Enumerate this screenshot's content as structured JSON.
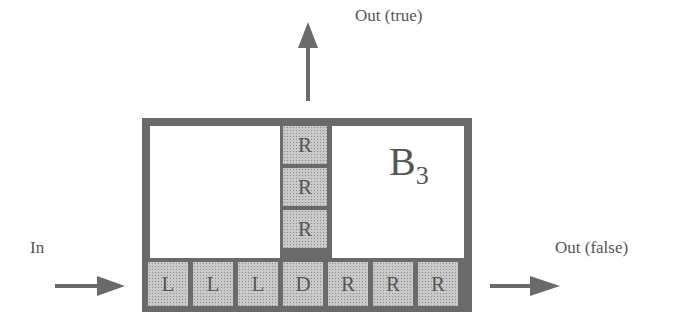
{
  "labels": {
    "out_true": "Out (true)",
    "out_false": "Out (false)",
    "in": "In"
  },
  "block": {
    "name": "B",
    "subscript": "3"
  },
  "column_cells": [
    "R",
    "R",
    "R"
  ],
  "row_cells": [
    "L",
    "L",
    "L",
    "D",
    "R",
    "R",
    "R"
  ],
  "colors": {
    "frame": "#6a6a6a",
    "cell": "#c9c9c9",
    "arrow": "#6a6a6a"
  }
}
